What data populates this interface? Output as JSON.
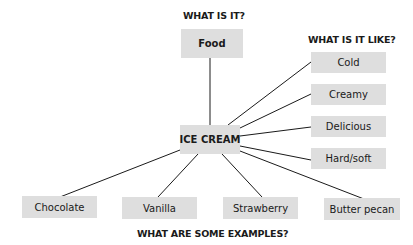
{
  "diagram": {
    "type": "concept-map",
    "center": {
      "label": "ICE CREAM"
    },
    "headings": {
      "what_is_it": "WHAT IS IT?",
      "what_is_it_like": "WHAT IS IT LIKE?",
      "examples": "WHAT ARE SOME EXAMPLES?"
    },
    "category": {
      "label": "Food"
    },
    "properties": [
      {
        "label": "Cold"
      },
      {
        "label": "Creamy"
      },
      {
        "label": "Delicious"
      },
      {
        "label": "Hard/soft"
      }
    ],
    "examples": [
      {
        "label": "Chocolate"
      },
      {
        "label": "Vanilla"
      },
      {
        "label": "Strawberry"
      },
      {
        "label": "Butter pecan"
      }
    ],
    "colors": {
      "box_fill": "#dedede",
      "line": "#1a1a1a",
      "text": "#1a1a1a"
    }
  }
}
